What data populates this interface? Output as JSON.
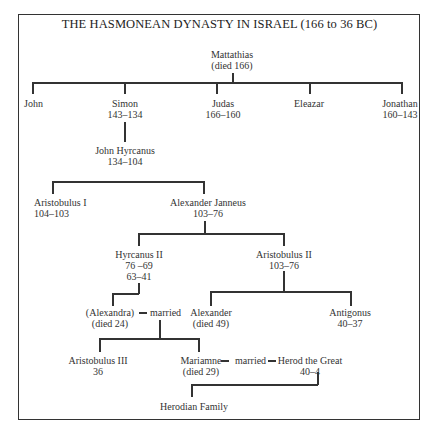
{
  "title": "THE HASMONEAN DYNASTY IN ISRAEL (166 to 36 BC)",
  "nodes": {
    "mattathias": {
      "name": "Mattathias",
      "dates": "(died 166)"
    },
    "john": {
      "name": "John"
    },
    "simon": {
      "name": "Simon",
      "dates": "143–134"
    },
    "judas": {
      "name": "Judas",
      "dates": "166–160"
    },
    "eleazar": {
      "name": "Eleazar"
    },
    "jonathan": {
      "name": "Jonathan",
      "dates": "160–143"
    },
    "john_hyrcanus": {
      "name": "John Hyrcanus",
      "dates": "134–104"
    },
    "aristobulus_1": {
      "name": "Aristobulus I",
      "dates": "104–103"
    },
    "alexander_janneus": {
      "name": "Alexander Janneus",
      "dates": "103–76"
    },
    "hyrcanus_2": {
      "name": "Hyrcanus II",
      "dates": "76 –69",
      "dates2": "63–41"
    },
    "aristobulus_2": {
      "name": "Aristobulus II",
      "dates": "103–76"
    },
    "alexandra": {
      "name": "(Alexandra)",
      "dates": "(died 24)"
    },
    "alexander": {
      "name": "Alexander",
      "dates": "(died 49)"
    },
    "antigonus": {
      "name": "Antigonus",
      "dates": "40–37"
    },
    "aristobulus_3": {
      "name": "Aristobulus III",
      "dates": "36"
    },
    "mariamne": {
      "name": "Mariamne",
      "dates": "(died 29)"
    },
    "herod": {
      "name": "Herod the Great",
      "dates": "40–4"
    },
    "herodian": {
      "name": "Herodian Family"
    }
  },
  "labels": {
    "married": "married"
  },
  "relations": [
    {
      "parent": "Mattathias",
      "children": [
        "John",
        "Simon",
        "Judas",
        "Eleazar",
        "Jonathan"
      ]
    },
    {
      "parent": "Simon",
      "children": [
        "John Hyrcanus"
      ]
    },
    {
      "parent": "John Hyrcanus",
      "children": [
        "Aristobulus I",
        "Alexander Janneus"
      ]
    },
    {
      "parent": "Alexander Janneus",
      "children": [
        "Hyrcanus II",
        "Aristobulus II"
      ]
    },
    {
      "parent": "Hyrcanus II",
      "children": [
        "(Alexandra)"
      ]
    },
    {
      "parent": "Aristobulus II",
      "children": [
        "Alexander",
        "Antigonus"
      ]
    },
    {
      "marriage": [
        "(Alexandra)",
        "Alexander"
      ],
      "children": [
        "Aristobulus III",
        "Mariamne"
      ]
    },
    {
      "marriage": [
        "Mariamne",
        "Herod the Great"
      ]
    },
    {
      "parent": "Herod the Great",
      "children": [
        "Herodian Family"
      ]
    }
  ]
}
